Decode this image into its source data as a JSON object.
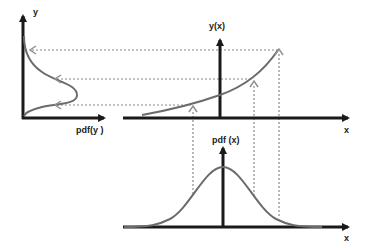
{
  "diagram": {
    "left_panel": {
      "y_axis_label": "y",
      "x_axis_label": "pdf(y )",
      "curve": "skewed density pdf(y)"
    },
    "middle_panel": {
      "y_axis_label": "y(x)",
      "x_axis_label": "x",
      "curve": "increasing convex function y(x)"
    },
    "bottom_panel": {
      "y_axis_label": "pdf (x)",
      "x_axis_label": "x",
      "curve": "gaussian pdf(x)"
    },
    "mappings": [
      {
        "x_px": 193,
        "y_px": 104
      },
      {
        "x_px": 253,
        "y_px": 78
      },
      {
        "x_px": 279,
        "y_px": 50
      }
    ],
    "colors": {
      "axis": "#1a1a1a",
      "curve": "#6b6b6b",
      "dashed": "#8a8a8a",
      "arrowhead": "#909090"
    }
  }
}
